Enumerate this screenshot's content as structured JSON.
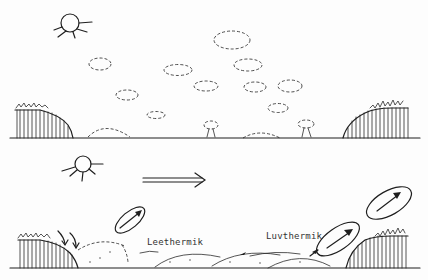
{
  "figure": {
    "panels": [
      {
        "id": "top",
        "description": "Calm conditions: sun, scattered cumulus clouds, hills with vegetation on both sides"
      },
      {
        "id": "bottom",
        "description": "Wind from left to right: lee and windward thermals"
      }
    ],
    "labels": {
      "lee_thermal": "Leethermik",
      "windward_thermal": "Luvthermik"
    },
    "icons": {
      "sun": "sun-icon",
      "wind_arrow": "double-arrow-right-icon"
    },
    "colors": {
      "ink": "#1e1e1e",
      "background": "#fdfdfd"
    }
  }
}
